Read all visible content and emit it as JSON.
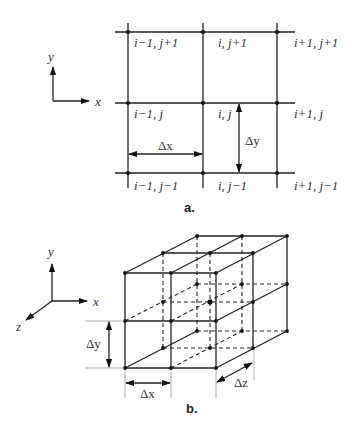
{
  "figure_a": {
    "caption": "a.",
    "axes": {
      "x_label": "x",
      "y_label": "y"
    },
    "node_labels": [
      [
        "i−1, j+1",
        "i, j+1",
        "i+1, j+1"
      ],
      [
        "i−1, j",
        "i, j",
        "i+1, j"
      ],
      [
        "i−1, j−1",
        "i, j−1",
        "i+1, j−1"
      ]
    ],
    "dimensions": {
      "dx": "Δx",
      "dy": "Δy"
    }
  },
  "figure_b": {
    "caption": "b.",
    "axes": {
      "x_label": "x",
      "y_label": "y",
      "z_label": "z"
    },
    "dimensions": {
      "dx": "Δx",
      "dy": "Δy",
      "dz": "Δz"
    }
  }
}
